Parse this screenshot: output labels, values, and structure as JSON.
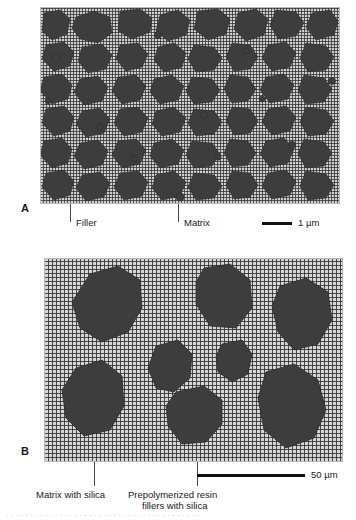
{
  "figure": {
    "panels": [
      {
        "letter": "A",
        "description": "Fine particle filled composite microstructure",
        "callouts": [
          {
            "label": "Filler"
          },
          {
            "label": "Matrix"
          }
        ],
        "scale_bar": {
          "label": "1 µm",
          "length_px": 30
        }
      },
      {
        "letter": "B",
        "description": "Prepolymerized resin filler composite microstructure",
        "callouts": [
          {
            "label": "Matrix with silica"
          },
          {
            "label": "Prepolymerized resin",
            "label_line2": "fillers with silica"
          }
        ],
        "scale_bar": {
          "label": "50 µm",
          "length_px": 108
        }
      }
    ]
  },
  "colors": {
    "filler_fill": "#3d3d3d",
    "filler_stroke": "#2b2b2b",
    "matrix_a_base": "#cfcfcf",
    "matrix_b_base": "#d6d6d6",
    "panel_border": "#b9b9b9",
    "leader_line": "#4a4a4a",
    "text": "#1a1a1a",
    "scale_bar": "#101010"
  },
  "caption_remnant": "· · · · · · · · · · · · · · · · · · · · · · · · · · · · · · · · · · · · · · · ·"
}
